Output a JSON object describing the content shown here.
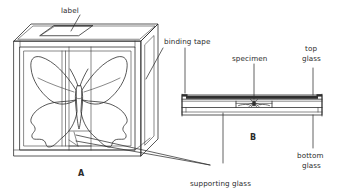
{
  "figure": {
    "background_color": "#ffffff",
    "ink_color": "#2f2f2f",
    "text_color": "#2b2b2b"
  },
  "labels": {
    "label": "label",
    "binding_tape": "binding tape",
    "supporting_glass": "supporting glass",
    "specimen": "specimen",
    "top_glass_line1": "top",
    "top_glass_line2": "glass",
    "bottom_glass_line1": "bottom",
    "bottom_glass_line2": "glass",
    "view_a": "A",
    "view_b": "B"
  },
  "views": {
    "a": {
      "name": "A",
      "caption": "A",
      "description": "Isometric view of a glass display case containing a mounted butterfly specimen with a paper label on the top face."
    },
    "b": {
      "name": "B",
      "caption": "B",
      "description": "Edge cross-section showing top glass, specimen, supporting glass, bottom glass and binding tape."
    }
  },
  "parts": [
    {
      "id": "label",
      "name": "label",
      "view": "A"
    },
    {
      "id": "binding-tape",
      "name": "binding tape",
      "view": "A"
    },
    {
      "id": "supporting-glass",
      "name": "supporting glass",
      "view": "A and B"
    },
    {
      "id": "specimen",
      "name": "specimen",
      "view": "B"
    },
    {
      "id": "top-glass",
      "name": "top glass",
      "view": "B"
    },
    {
      "id": "bottom-glass",
      "name": "bottom glass",
      "view": "B"
    }
  ]
}
